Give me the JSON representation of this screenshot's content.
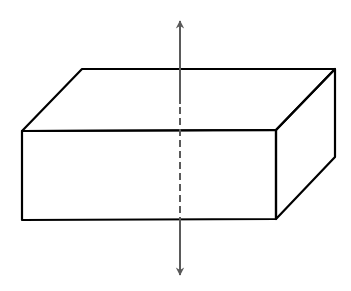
{
  "diagram": {
    "colors": {
      "background": "#ffffff",
      "box_stroke": "#000000",
      "axis_stroke": "#5a5a5a"
    },
    "box": {
      "stroke_width": 2.2,
      "vertices": {
        "front_top_left": [
          22,
          131
        ],
        "front_top_right": [
          276,
          130
        ],
        "front_bottom_left": [
          22,
          220
        ],
        "front_bottom_right": [
          276,
          219
        ],
        "back_top_left": [
          82,
          69
        ],
        "back_top_right": [
          335,
          69
        ],
        "back_bottom_right": [
          335,
          157
        ]
      }
    },
    "axis": {
      "x": 180,
      "stroke_width": 2,
      "top_arrow_tip": [
        180,
        19
      ],
      "bottom_arrow_tip": [
        180,
        277
      ],
      "solid_top_end": 104,
      "dashed_start": 107,
      "dashed_end": 219,
      "dash_pattern": "7,4"
    }
  }
}
